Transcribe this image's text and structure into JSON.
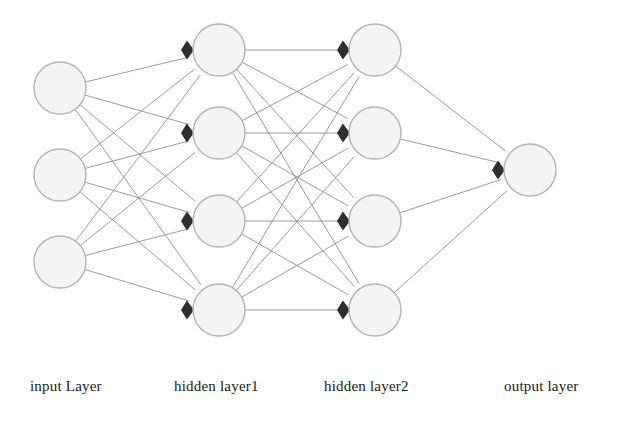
{
  "figure": {
    "kind": "neural-network-diagram",
    "background_color": "#ffffff",
    "node_fill_color": "#f4f4f4",
    "node_stroke_color": "#b4b4b4",
    "edge_color": "#8d8d8d",
    "arrow_color": "#2e2e2e",
    "label_color": "#1a1a1a"
  },
  "labels": {
    "input": "input Layer",
    "hidden1": "hidden layer1",
    "hidden2": "hidden layer2",
    "output": "output layer"
  },
  "network": {
    "node_radius": 26,
    "layers": [
      {
        "id": "input",
        "label": "input Layer",
        "x": 60,
        "count": 3,
        "has_arrow": false,
        "nodes": [
          {
            "cx": 60,
            "cy": 88
          },
          {
            "cx": 60,
            "cy": 175
          },
          {
            "cx": 60,
            "cy": 262
          }
        ]
      },
      {
        "id": "hidden1",
        "label": "hidden layer1",
        "x": 219,
        "count": 4,
        "has_arrow": true,
        "nodes": [
          {
            "cx": 219,
            "cy": 50
          },
          {
            "cx": 219,
            "cy": 133
          },
          {
            "cx": 219,
            "cy": 221
          },
          {
            "cx": 219,
            "cy": 310
          }
        ]
      },
      {
        "id": "hidden2",
        "label": "hidden layer2",
        "x": 375,
        "count": 4,
        "has_arrow": true,
        "nodes": [
          {
            "cx": 375,
            "cy": 50
          },
          {
            "cx": 375,
            "cy": 133
          },
          {
            "cx": 375,
            "cy": 221
          },
          {
            "cx": 375,
            "cy": 310
          }
        ]
      },
      {
        "id": "output",
        "label": "output layer",
        "x": 530,
        "count": 1,
        "has_arrow": true,
        "nodes": [
          {
            "cx": 530,
            "cy": 170
          }
        ]
      }
    ],
    "connections": [
      {
        "from": "input",
        "to": "hidden1",
        "type": "fully-connected",
        "edge_count": 12
      },
      {
        "from": "hidden1",
        "to": "hidden2",
        "type": "fully-connected",
        "edge_count": 16
      },
      {
        "from": "hidden2",
        "to": "output",
        "type": "fully-connected",
        "edge_count": 4
      }
    ]
  }
}
